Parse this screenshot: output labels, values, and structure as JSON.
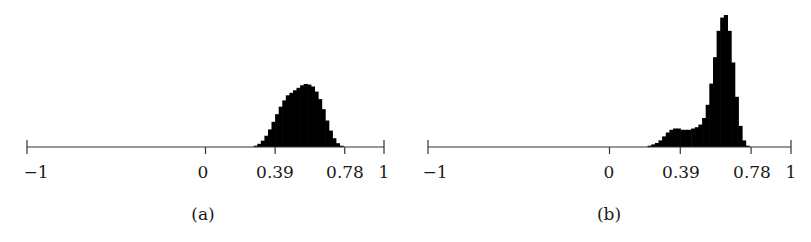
{
  "chart_data": [
    {
      "type": "bar",
      "subtype": "histogram",
      "caption": "(a)",
      "xlim": [
        -1,
        1
      ],
      "xticks": [
        -1,
        0,
        0.39,
        0.78,
        1
      ],
      "xtick_labels": [
        "−1",
        "0",
        "0.39",
        "0.78",
        "1"
      ],
      "yaxis_visible": false,
      "grid": false,
      "fill_color": "#000000",
      "bins_x": [
        0.28,
        0.3,
        0.32,
        0.34,
        0.36,
        0.38,
        0.4,
        0.42,
        0.44,
        0.46,
        0.48,
        0.5,
        0.52,
        0.54,
        0.56,
        0.58,
        0.6,
        0.62,
        0.64,
        0.66,
        0.68,
        0.7,
        0.72,
        0.74,
        0.76
      ],
      "bins_rel_height": [
        0.02,
        0.05,
        0.1,
        0.18,
        0.28,
        0.4,
        0.52,
        0.64,
        0.74,
        0.82,
        0.86,
        0.9,
        0.94,
        0.98,
        1.0,
        0.99,
        0.96,
        0.88,
        0.76,
        0.6,
        0.42,
        0.26,
        0.14,
        0.06,
        0.02
      ]
    },
    {
      "type": "bar",
      "subtype": "histogram",
      "caption": "(b)",
      "xlim": [
        -1,
        1
      ],
      "xticks": [
        -1,
        0,
        0.39,
        0.78,
        1
      ],
      "xtick_labels": [
        "−1",
        "0",
        "0.39",
        "0.78",
        "1"
      ],
      "yaxis_visible": false,
      "grid": false,
      "fill_color": "#000000",
      "bins_x": [
        0.22,
        0.24,
        0.26,
        0.28,
        0.3,
        0.32,
        0.34,
        0.36,
        0.38,
        0.4,
        0.42,
        0.44,
        0.46,
        0.48,
        0.5,
        0.52,
        0.54,
        0.56,
        0.58,
        0.6,
        0.62,
        0.64,
        0.66,
        0.68,
        0.7,
        0.72,
        0.74,
        0.76
      ],
      "bins_rel_height": [
        0.01,
        0.02,
        0.03,
        0.05,
        0.08,
        0.11,
        0.13,
        0.14,
        0.14,
        0.13,
        0.13,
        0.13,
        0.14,
        0.15,
        0.17,
        0.22,
        0.32,
        0.48,
        0.68,
        0.88,
        0.98,
        1.0,
        0.88,
        0.64,
        0.38,
        0.16,
        0.05,
        0.01
      ]
    }
  ],
  "panels": [
    {
      "caption": "(a)",
      "tick_labels": [
        "−1",
        "0",
        "0.39",
        "0.78",
        "1"
      ]
    },
    {
      "caption": "(b)",
      "tick_labels": [
        "−1",
        "0",
        "0.39",
        "0.78",
        "1"
      ]
    }
  ]
}
